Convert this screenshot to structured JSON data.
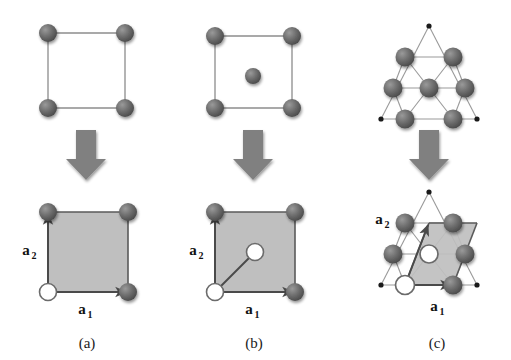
{
  "figure": {
    "background": "#ffffff",
    "width": 511,
    "height": 360,
    "atom_color": "#6e6e6e",
    "atom_dark": "#4f4f4f",
    "bond_color": "#8c8c8c",
    "cell_fill": "#bfbfbf",
    "cell_edge": "#5a5a5a",
    "arrow_color": "#808080",
    "dot_color": "#1a1a1a",
    "open_circle_fill": "#ffffff",
    "open_circle_stroke": "#6b6b6b",
    "text_color": "#1a1a1a"
  },
  "panels": [
    {
      "id": "a",
      "caption": "(a)",
      "lattice_name": "square-lattice",
      "basis_count": 1,
      "top_description": "square lattice with atoms at the four corners",
      "bottom_description": "square primitive unit cell with one basis atom at origin",
      "vector_labels": {
        "a1": "a",
        "a1_sub": "1",
        "a2": "a",
        "a2_sub": "2"
      },
      "top_atoms": [
        {
          "x": 0,
          "y": 0
        },
        {
          "x": 1,
          "y": 0
        },
        {
          "x": 0,
          "y": 1
        },
        {
          "x": 1,
          "y": 1
        }
      ],
      "cell_shape": "square",
      "basis_points": [
        {
          "x": 0,
          "y": 0
        }
      ]
    },
    {
      "id": "b",
      "caption": "(b)",
      "lattice_name": "centered-square-lattice",
      "basis_count": 2,
      "top_description": "square lattice with atoms at the four corners and one atom at the centre",
      "bottom_description": "square unit cell with a two-atom basis: origin and centre",
      "vector_labels": {
        "a1": "a",
        "a1_sub": "1",
        "a2": "a",
        "a2_sub": "2"
      },
      "top_atoms": [
        {
          "x": 0,
          "y": 0
        },
        {
          "x": 1,
          "y": 0
        },
        {
          "x": 0,
          "y": 1
        },
        {
          "x": 1,
          "y": 1
        },
        {
          "x": 0.5,
          "y": 0.5
        }
      ],
      "cell_shape": "square",
      "basis_points": [
        {
          "x": 0,
          "y": 0
        },
        {
          "x": 0.5,
          "y": 0.5
        }
      ]
    },
    {
      "id": "c",
      "caption": "(c)",
      "lattice_name": "triangular-honeycomb-lattice",
      "basis_count": 2,
      "top_description": "triangular lattice arranged in a larger triangle with small dot lattice sites at the outer vertices",
      "bottom_description": "oblique (rhombic) primitive cell with a two-atom basis",
      "vector_labels": {
        "a1": "a",
        "a1_sub": "1",
        "a2": "a",
        "a2_sub": "2"
      },
      "cell_shape": "parallelogram",
      "basis_points": [
        {
          "x": 0,
          "y": 0
        },
        {
          "x": 0.5,
          "y": 0.5
        }
      ]
    }
  ],
  "arrows": [
    {
      "name": "transform-arrow-a",
      "direction": "down"
    },
    {
      "name": "transform-arrow-b",
      "direction": "down"
    },
    {
      "name": "transform-arrow-c",
      "direction": "down"
    }
  ]
}
